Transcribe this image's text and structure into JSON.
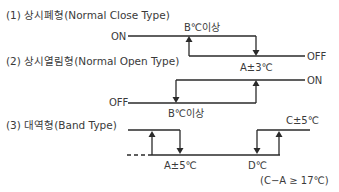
{
  "sections": [
    {
      "title": "(1) 상시폐형(Normal Close Type)",
      "labels": {
        "on": "ON",
        "off": "OFF",
        "threshold_high": "B℃이상",
        "threshold_low": "A±3℃"
      }
    },
    {
      "title": "(2) 상시열림형(Normal Open Type)",
      "labels": {
        "on": "ON",
        "off": "OFF",
        "threshold_high": "B℃이상"
      }
    },
    {
      "title": "(3) 대역형(Band Type)",
      "labels": {
        "low_point": "A±5℃",
        "d_point": "D℃",
        "high_point": "C±5℃",
        "condition": "(C−A ≥ 17℃)"
      }
    }
  ]
}
